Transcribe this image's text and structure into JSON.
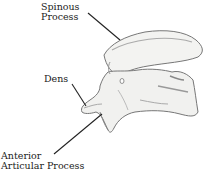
{
  "diagram": {
    "labels": [
      {
        "id": "spinous",
        "lines": [
          "Spinous",
          "Process"
        ]
      },
      {
        "id": "dens",
        "lines": [
          "Dens"
        ]
      },
      {
        "id": "anterior",
        "lines": [
          "Anterior",
          "Articular Process"
        ]
      }
    ],
    "colors": {
      "line": "#222222",
      "bone_fill": "#f2f2f0",
      "bone_stroke": "#666666",
      "shade": "#9a9a9a"
    }
  }
}
